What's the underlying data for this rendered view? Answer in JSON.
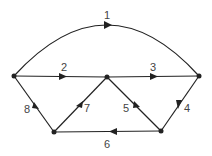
{
  "diagram": {
    "type": "directed-graph",
    "nodes": [
      {
        "id": "L",
        "x": 14,
        "y": 76
      },
      {
        "id": "C",
        "x": 107,
        "y": 77
      },
      {
        "id": "R",
        "x": 199,
        "y": 76
      },
      {
        "id": "BL",
        "x": 54,
        "y": 132
      },
      {
        "id": "BR",
        "x": 161,
        "y": 131
      }
    ],
    "edges": [
      {
        "label": "1",
        "from": "L",
        "to": "R",
        "shape": "arc"
      },
      {
        "label": "2",
        "from": "L",
        "to": "C"
      },
      {
        "label": "3",
        "from": "C",
        "to": "R"
      },
      {
        "label": "4",
        "from": "R",
        "to": "BR"
      },
      {
        "label": "5",
        "from": "BR",
        "to": "C"
      },
      {
        "label": "6",
        "from": "BR",
        "to": "BL"
      },
      {
        "label": "7",
        "from": "BL",
        "to": "C"
      },
      {
        "label": "8",
        "from": "BL",
        "to": "L"
      }
    ],
    "colors": {
      "line": "#222222",
      "label": "#444444",
      "background": "#ffffff"
    }
  }
}
